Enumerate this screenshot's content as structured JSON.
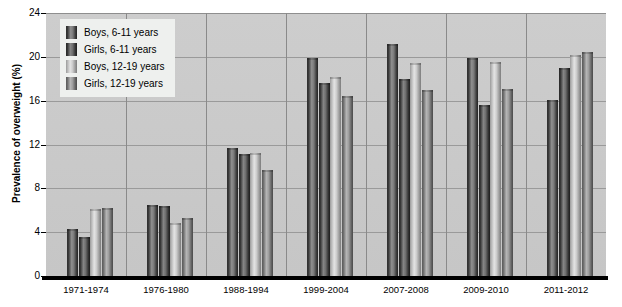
{
  "chart_data": {
    "type": "bar",
    "title": "",
    "xlabel": "",
    "ylabel": "Prevalence of overweight (%)",
    "ylim": [
      0,
      24
    ],
    "yticks": [
      0,
      4,
      8,
      12,
      16,
      20,
      24
    ],
    "grid": true,
    "legend_position": "upper-left",
    "categories": [
      "1971-1974",
      "1976-1980",
      "1988-1994",
      "1999-2004",
      "2007-2008",
      "2009-2010",
      "2011-2012"
    ],
    "series": [
      {
        "name": "Boys, 6-11 years",
        "color": "#3a3a3a",
        "values": [
          4.3,
          6.5,
          11.7,
          19.9,
          21.2,
          19.9,
          16.1
        ]
      },
      {
        "name": "Girls, 6-11 years",
        "color": "#303030",
        "values": [
          3.6,
          6.4,
          11.1,
          17.6,
          18.0,
          15.6,
          19.0
        ]
      },
      {
        "name": "Boys, 12-19 years",
        "color": "#d0d0d0",
        "values": [
          6.1,
          4.8,
          11.2,
          18.2,
          19.4,
          19.5,
          20.2
        ]
      },
      {
        "name": "Girls, 12-19 years",
        "color": "#9a9a9a",
        "values": [
          6.2,
          5.3,
          9.7,
          16.4,
          17.0,
          17.1,
          20.4
        ]
      }
    ]
  },
  "legend": {
    "items": [
      {
        "label": "Boys, 6-11 years"
      },
      {
        "label": "Girls, 6-11 years"
      },
      {
        "label": "Boys, 12-19 years"
      },
      {
        "label": "Girls, 12-19 years"
      }
    ]
  },
  "axis": {
    "y_title": "Prevalence of overweight (%)",
    "y_tick_labels": [
      "24",
      "20",
      "16",
      "12",
      "8",
      "4",
      "0"
    ],
    "x_tick_labels": [
      "1971-1974",
      "1976-1980",
      "1988-1994",
      "1999-2004",
      "2007-2008",
      "2009-2010",
      "2011-2012"
    ]
  }
}
